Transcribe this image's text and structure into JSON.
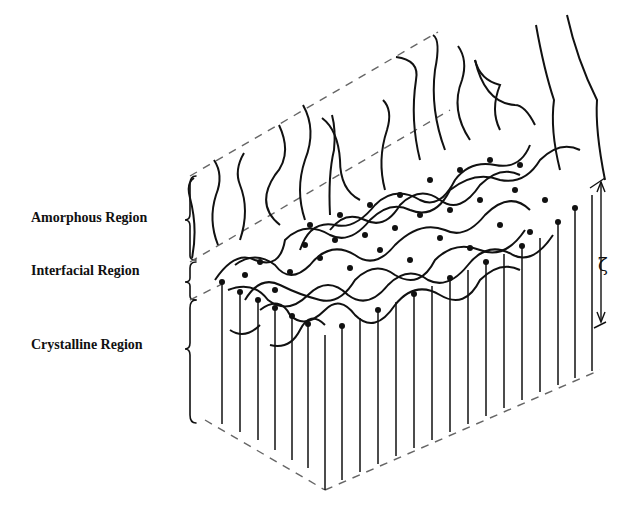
{
  "figure": {
    "type": "schematic",
    "labels": {
      "amorphous": "Amorphous Region",
      "interfacial": "Interfacial Region",
      "crystalline": "Crystalline Region"
    },
    "thickness_symbol": "ζ",
    "colors": {
      "ink": "#111111",
      "dash": "#666666",
      "background": "#ffffff"
    }
  }
}
